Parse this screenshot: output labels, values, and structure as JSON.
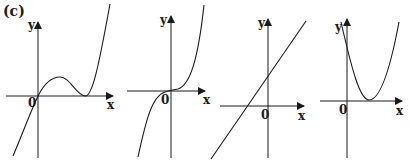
{
  "figure": {
    "label": "(c)",
    "panels": [
      {
        "id": "panel-1",
        "curve_type": "cubic with local max and double root",
        "y_label": "y",
        "x_label": "x",
        "origin_label": "0"
      },
      {
        "id": "panel-2",
        "curve_type": "cubic with inflection at origin",
        "y_label": "y",
        "x_label": "x",
        "origin_label": "0"
      },
      {
        "id": "panel-3",
        "curve_type": "increasing straight line",
        "y_label": "y",
        "x_label": "x",
        "origin_label": "0"
      },
      {
        "id": "panel-4",
        "curve_type": "upward parabola touching x-axis",
        "y_label": "y",
        "x_label": "x",
        "origin_label": "0"
      }
    ]
  },
  "colors": {
    "ink": "#1a1a1a",
    "background": "#ffffff"
  }
}
